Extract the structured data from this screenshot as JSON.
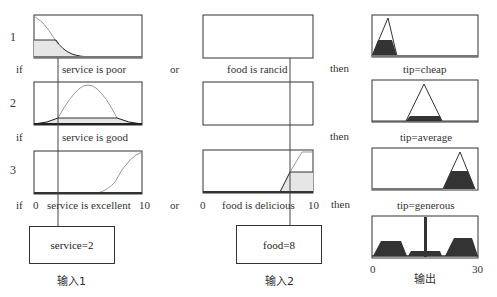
{
  "rules": [
    {
      "number": "1",
      "if": "if",
      "input1_label": "service is poor",
      "connector": "or",
      "input2_label": "food is rancid",
      "then": "then",
      "output_label": "tip=cheap"
    },
    {
      "number": "2",
      "if": "if",
      "input1_label": "service is good",
      "connector": "",
      "input2_label": "",
      "then": "then",
      "output_label": "tip=average"
    },
    {
      "number": "3",
      "if": "if",
      "input1_label": "service is excellent",
      "connector": "or",
      "input2_label": "food is delicious",
      "then": "then",
      "output_label": "tip=generous"
    }
  ],
  "axes": {
    "input1_min": "0",
    "input1_max": "10",
    "input2_min": "0",
    "input2_max": "10",
    "output_min": "0",
    "output_max": "30"
  },
  "inputs": {
    "input1": {
      "value_text": "service=2",
      "caption": "输入1"
    },
    "input2": {
      "value_text": "food=8",
      "caption": "输入2"
    }
  },
  "output": {
    "caption": "输出"
  },
  "colors": {
    "mf_curve": "#999999",
    "activated_curve": "#222222",
    "fill_light": "#e6e6e6",
    "fill_dark": "#333333",
    "frame": "#333333"
  }
}
